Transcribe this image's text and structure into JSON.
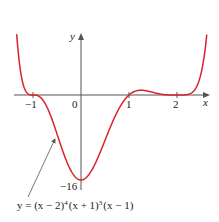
{
  "chart_data": {
    "type": "line",
    "title": "",
    "function": "(x-2)^4 (x+1)^3 (x-1)",
    "xlabel": "x",
    "ylabel": "y",
    "x_ticks": [
      {
        "value": -1,
        "label": "−1"
      },
      {
        "value": 1,
        "label": "1"
      },
      {
        "value": 2,
        "label": "2"
      }
    ],
    "origin_label": "0",
    "y_ticks": [
      {
        "value": -16,
        "label": "−16"
      }
    ],
    "xlim": [
      -1.35,
      2.62
    ],
    "ylim": [
      -16,
      12
    ],
    "grid": false,
    "series": [
      {
        "name": "y = (x − 2)^4 (x + 1)^3 (x − 1)",
        "color": "#d8232a",
        "x": [
          -1.33,
          -1.2,
          -1.0,
          -0.8,
          -0.5,
          -0.2,
          0.0,
          0.3,
          0.6,
          1.0,
          1.4,
          1.8,
          2.0,
          2.3,
          2.62
        ],
        "y": [
          10.6,
          3.2,
          0.0,
          -1.3,
          -6.0,
          -12.3,
          -16.0,
          -13.6,
          -6.0,
          0.0,
          0.9,
          0.01,
          0.0,
          0.25,
          11.4
        ]
      }
    ],
    "annotation": {
      "text_parts": [
        "y = (x − 2)",
        "4",
        "(x + 1)",
        "3",
        "(x − 1)"
      ],
      "points_to": {
        "x": -0.55,
        "y": -5.4
      }
    },
    "colors": {
      "curve": "#d8232a",
      "axes": "#555555",
      "text": "#222222"
    }
  }
}
